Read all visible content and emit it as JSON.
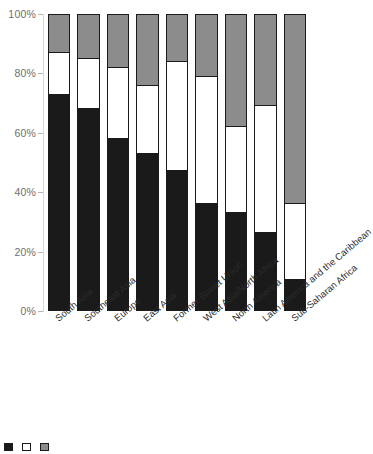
{
  "chart_data": {
    "type": "bar",
    "stacked": true,
    "stack_mode": "percent",
    "title": "",
    "subtitle": "",
    "xlabel": "",
    "ylabel": "",
    "ylim": [
      0,
      100
    ],
    "yticks": [
      "0%",
      "20%",
      "40%",
      "60%",
      "80%",
      "100%"
    ],
    "ytick_values": [
      0,
      20,
      40,
      60,
      80,
      100
    ],
    "grid": false,
    "legend_position": "bottom",
    "categories": [
      "South Asia",
      "Southeast Asia",
      "Europe",
      "East Asia",
      "Former Soviet Union",
      "West Asia/North Africa",
      "North America",
      "Latin America and the Caribbean",
      "Sub-Saharan Africa"
    ],
    "series": [
      {
        "name": "Low",
        "color": "#1a1a1a",
        "values": [
          73,
          68,
          58,
          53,
          47,
          36,
          33,
          26,
          10
        ]
      },
      {
        "name": "Medium",
        "color": "#ffffff",
        "values": [
          14,
          17,
          24,
          23,
          37,
          43,
          29,
          43,
          26
        ]
      },
      {
        "name": "High",
        "color": "#8c8c8c",
        "values": [
          13,
          15,
          18,
          24,
          16,
          21,
          38,
          31,
          64
        ]
      }
    ],
    "segment_tops": {
      "black_top": [
        73,
        68,
        58,
        53,
        47,
        36,
        33,
        26,
        10
      ],
      "white_top": [
        87,
        85,
        82,
        76,
        84,
        79,
        62,
        69,
        36
      ]
    }
  },
  "legend": {
    "items": [
      {
        "swatch_color": "#1a1a1a",
        "label": ""
      },
      {
        "swatch_color": "#ffffff",
        "label": ""
      },
      {
        "swatch_color": "#8c8c8c",
        "label": ""
      }
    ],
    "note": "legend row is cut off at the bottom edge of the screenshot"
  },
  "colors": {
    "segment_low": "#1a1a1a",
    "segment_medium": "#ffffff",
    "segment_high": "#8c8c8c",
    "outline": "#1a1a1a",
    "axis_text": "#6e6e6e",
    "label_text": "#2b2b2b",
    "background": "#ffffff"
  }
}
